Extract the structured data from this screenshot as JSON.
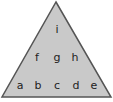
{
  "diagram": {
    "shape": "triangle",
    "fill_color": "#c9c9c9",
    "stroke_color": "#555555",
    "rows": [
      {
        "name": "top",
        "labels": [
          "i"
        ]
      },
      {
        "name": "middle",
        "labels": [
          "f",
          "g",
          "h"
        ]
      },
      {
        "name": "bottom",
        "labels": [
          "a",
          "b",
          "c",
          "d",
          "e"
        ]
      }
    ]
  }
}
